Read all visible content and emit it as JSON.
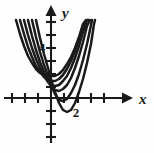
{
  "figure": {
    "title": "",
    "background": "#fefefe",
    "ink_color": "#1a1a1a",
    "width": 154,
    "height": 153
  },
  "axes": {
    "x_axis": {
      "label": "x",
      "label_x": 140,
      "label_y": 100,
      "y_pixel": 98,
      "start_x": 4,
      "end_x": 128,
      "arrow": "right",
      "ticks_px": [
        12,
        25,
        38,
        64,
        78,
        91,
        104
      ],
      "tick_half_len": 5
    },
    "y_axis": {
      "label": "y",
      "label_x": 62,
      "label_y": 14,
      "x_pixel": 51,
      "start_y": 8,
      "end_y": 143,
      "arrow": "up",
      "ticks_px": [
        22,
        35,
        48,
        61,
        74,
        87,
        111,
        124,
        137
      ],
      "tick_half_len": 5
    },
    "origin_px": [
      51,
      98
    ],
    "unit_px": 13
  },
  "tick_labels": [
    {
      "text": "4",
      "x": 42,
      "y": 52,
      "axis": "y",
      "value": 4
    },
    {
      "text": "2",
      "x": 76,
      "y": 117,
      "axis": "x",
      "value": 2
    }
  ],
  "chart_data": {
    "type": "line",
    "title": "",
    "xlabel": "x",
    "ylabel": "y",
    "grid": false,
    "legend": null,
    "xlim": [
      -4,
      6
    ],
    "ylim": [
      -2,
      7.5
    ],
    "series": [
      {
        "name": "curve-1",
        "vertex": [
          0.0,
          3.6
        ],
        "a": 1.0,
        "points_px": [
          [
            16,
            20
          ],
          [
            20,
            34
          ],
          [
            24,
            46
          ],
          [
            28,
            56
          ],
          [
            32,
            63
          ],
          [
            36,
            69
          ],
          [
            40,
            73
          ],
          [
            44,
            75
          ],
          [
            48,
            76
          ],
          [
            51,
            76
          ],
          [
            55,
            76
          ],
          [
            59,
            74
          ],
          [
            63,
            70
          ],
          [
            67,
            64
          ],
          [
            71,
            57
          ],
          [
            75,
            48
          ],
          [
            79,
            37
          ],
          [
            83,
            24
          ],
          [
            86,
            20
          ]
        ]
      },
      {
        "name": "curve-2",
        "vertex": [
          0.0,
          2.6
        ],
        "a": 1.0,
        "points_px": [
          [
            20,
            20
          ],
          [
            24,
            34
          ],
          [
            28,
            47
          ],
          [
            32,
            57
          ],
          [
            36,
            66
          ],
          [
            40,
            72
          ],
          [
            44,
            77
          ],
          [
            48,
            80
          ],
          [
            51,
            81
          ],
          [
            55,
            81
          ],
          [
            59,
            79
          ],
          [
            63,
            75
          ],
          [
            67,
            69
          ],
          [
            71,
            61
          ],
          [
            75,
            51
          ],
          [
            79,
            39
          ],
          [
            83,
            25
          ],
          [
            87,
            20
          ]
        ]
      },
      {
        "name": "curve-3",
        "vertex": [
          0.0,
          1.6
        ],
        "a": 1.0,
        "points_px": [
          [
            24,
            20
          ],
          [
            28,
            35
          ],
          [
            32,
            48
          ],
          [
            36,
            59
          ],
          [
            40,
            68
          ],
          [
            44,
            76
          ],
          [
            48,
            82
          ],
          [
            51,
            85
          ],
          [
            55,
            86
          ],
          [
            59,
            85
          ],
          [
            63,
            81
          ],
          [
            67,
            76
          ],
          [
            71,
            68
          ],
          [
            75,
            58
          ],
          [
            79,
            46
          ],
          [
            83,
            32
          ],
          [
            87,
            20
          ],
          [
            89,
            20
          ]
        ]
      },
      {
        "name": "curve-4",
        "vertex": [
          0.0,
          0.6
        ],
        "a": 1.0,
        "points_px": [
          [
            28,
            20
          ],
          [
            32,
            36
          ],
          [
            36,
            50
          ],
          [
            40,
            62
          ],
          [
            44,
            72
          ],
          [
            48,
            80
          ],
          [
            51,
            87
          ],
          [
            55,
            90
          ],
          [
            59,
            91
          ],
          [
            63,
            89
          ],
          [
            67,
            85
          ],
          [
            71,
            78
          ],
          [
            75,
            68
          ],
          [
            79,
            56
          ],
          [
            83,
            42
          ],
          [
            87,
            26
          ],
          [
            90,
            20
          ]
        ]
      },
      {
        "name": "curve-5",
        "vertex": [
          0.0,
          -0.4
        ],
        "a": 1.0,
        "points_px": [
          [
            32,
            20
          ],
          [
            36,
            37
          ],
          [
            40,
            52
          ],
          [
            44,
            65
          ],
          [
            48,
            76
          ],
          [
            51,
            85
          ],
          [
            55,
            94
          ],
          [
            59,
            100
          ],
          [
            63,
            101
          ],
          [
            67,
            99
          ],
          [
            71,
            93
          ],
          [
            75,
            85
          ],
          [
            79,
            74
          ],
          [
            83,
            60
          ],
          [
            87,
            44
          ],
          [
            91,
            25
          ],
          [
            92,
            20
          ]
        ]
      },
      {
        "name": "curve-6",
        "vertex": [
          0.0,
          -1.4
        ],
        "a": 1.0,
        "points_px": [
          [
            36,
            20
          ],
          [
            40,
            38
          ],
          [
            44,
            54
          ],
          [
            48,
            68
          ],
          [
            51,
            79
          ],
          [
            55,
            92
          ],
          [
            59,
            103
          ],
          [
            63,
            110
          ],
          [
            67,
            112
          ],
          [
            71,
            110
          ],
          [
            75,
            103
          ],
          [
            79,
            92
          ],
          [
            83,
            79
          ],
          [
            87,
            63
          ],
          [
            91,
            44
          ],
          [
            94,
            24
          ],
          [
            95,
            20
          ]
        ]
      }
    ]
  }
}
